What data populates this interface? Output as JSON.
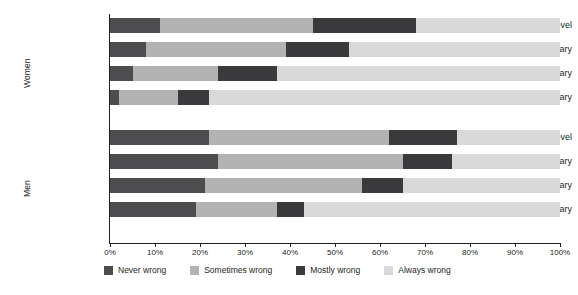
{
  "chart_data": {
    "type": "bar",
    "orientation": "horizontal",
    "stacked": true,
    "stack_mode": "percent",
    "title": "",
    "subtitle": "",
    "xlabel": "",
    "ylabel": "",
    "xlim": [
      0,
      100
    ],
    "xticks": [
      0,
      10,
      20,
      30,
      40,
      50,
      60,
      70,
      80,
      90,
      100
    ],
    "xtick_labels": [
      "0%",
      "10%",
      "20%",
      "30%",
      "40%",
      "50%",
      "60%",
      "70%",
      "80%",
      "90%",
      "100%"
    ],
    "grid": false,
    "legend_position": "bottom",
    "legend": [
      "Never wrong",
      "Sometimes wrong",
      "Mostly wrong",
      "Always wrong"
    ],
    "series": [
      {
        "name": "Never wrong",
        "color": "#4d4d4f"
      },
      {
        "name": "Sometimes wrong",
        "color": "#b3b3b3"
      },
      {
        "name": "Mostly wrong",
        "color": "#3a3a3c"
      },
      {
        "name": "Always wrong",
        "color": "#d9d9d9"
      }
    ],
    "groups": [
      {
        "name": "Women",
        "categories": [
          "Third level",
          "Upper secondary",
          "Lower secondary",
          "Primary"
        ],
        "rows": [
          {
            "category": "Third level",
            "values": [
              11,
              34,
              23,
              32
            ]
          },
          {
            "category": "Upper secondary",
            "values": [
              8,
              31,
              14,
              47
            ]
          },
          {
            "category": "Lower secondary",
            "values": [
              5,
              19,
              13,
              63
            ]
          },
          {
            "category": "Primary",
            "values": [
              2,
              13,
              7,
              78
            ]
          }
        ]
      },
      {
        "name": "Men",
        "categories": [
          "Third level",
          "Upper secondary",
          "Lower secondary",
          "Primary"
        ],
        "rows": [
          {
            "category": "Third level",
            "values": [
              22,
              40,
              15,
              23
            ]
          },
          {
            "category": "Upper secondary",
            "values": [
              24,
              41,
              11,
              24
            ]
          },
          {
            "category": "Lower secondary",
            "values": [
              21,
              35,
              9,
              35
            ]
          },
          {
            "category": "Primary",
            "values": [
              19,
              18,
              6,
              57
            ]
          }
        ]
      }
    ]
  },
  "axis": {
    "women_label": "Women",
    "men_label": "Men"
  },
  "colors": {
    "never_wrong": "#4d4d4f",
    "sometimes_wrong": "#b3b3b3",
    "mostly_wrong": "#3a3a3c",
    "always_wrong": "#d9d9d9",
    "axis": "#231f20",
    "background": "#ffffff"
  }
}
